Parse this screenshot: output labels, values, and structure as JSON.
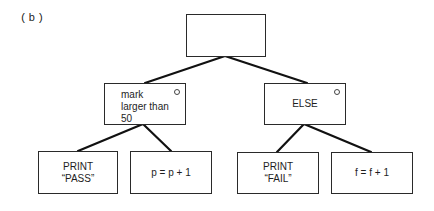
{
  "figure_label": "(b)",
  "nodes": {
    "root": {
      "text": ""
    },
    "condition": {
      "line1": "mark",
      "line2": "larger than",
      "line3": "50",
      "marker": "selection-circle"
    },
    "else": {
      "text": "ELSE",
      "marker": "selection-circle"
    },
    "print_pass": {
      "line1": "PRINT",
      "line2": "“PASS”"
    },
    "increment_p": {
      "text": "p = p + 1"
    },
    "print_fail": {
      "line1": "PRINT",
      "line2": "“FAIL”"
    },
    "increment_f": {
      "text": "f = f + 1"
    }
  },
  "edges": [
    [
      "root",
      "condition"
    ],
    [
      "root",
      "else"
    ],
    [
      "condition",
      "print_pass"
    ],
    [
      "condition",
      "increment_p"
    ],
    [
      "else",
      "print_fail"
    ],
    [
      "else",
      "increment_f"
    ]
  ]
}
